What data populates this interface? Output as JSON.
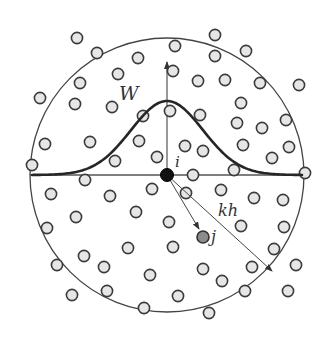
{
  "diagram": {
    "labels": {
      "kernel": "W",
      "center_particle": "i",
      "neighbor_particle": "j",
      "support_radius": "kh"
    },
    "colors": {
      "background": "#ffffff",
      "stroke": "#333333",
      "kernel_curve": "#262626",
      "particle_fill": "#e6e6e6",
      "particle_stroke": "#3a3a3a",
      "center_particle_fill": "#111111",
      "neighbor_particle_fill": "#8c8c8c"
    },
    "support_circle": {
      "cx": 167,
      "cy": 175,
      "r": 137
    },
    "center_particle": {
      "x": 167,
      "y": 175,
      "r": 6
    },
    "neighbor_particle": {
      "x": 203,
      "y": 237,
      "r": 6
    },
    "particles": [
      [
        77,
        38
      ],
      [
        97,
        53
      ],
      [
        138,
        58
      ],
      [
        118,
        74
      ],
      [
        80,
        83
      ],
      [
        40,
        98
      ],
      [
        75,
        104
      ],
      [
        112,
        107
      ],
      [
        143,
        116
      ],
      [
        45,
        144
      ],
      [
        90,
        142
      ],
      [
        139,
        141
      ],
      [
        32,
        165
      ],
      [
        115,
        161
      ],
      [
        157,
        157
      ],
      [
        215,
        35
      ],
      [
        175,
        46
      ],
      [
        215,
        56
      ],
      [
        246,
        51
      ],
      [
        173,
        71
      ],
      [
        198,
        81
      ],
      [
        225,
        80
      ],
      [
        260,
        83
      ],
      [
        299,
        85
      ],
      [
        241,
        103
      ],
      [
        170,
        111
      ],
      [
        200,
        115
      ],
      [
        237,
        123
      ],
      [
        262,
        128
      ],
      [
        286,
        120
      ],
      [
        185,
        146
      ],
      [
        203,
        151
      ],
      [
        243,
        145
      ],
      [
        289,
        147
      ],
      [
        272,
        158
      ],
      [
        234,
        170
      ],
      [
        305,
        173
      ],
      [
        85,
        180
      ],
      [
        51,
        194
      ],
      [
        110,
        196
      ],
      [
        152,
        189
      ],
      [
        76,
        217
      ],
      [
        136,
        212
      ],
      [
        47,
        228
      ],
      [
        128,
        248
      ],
      [
        84,
        256
      ],
      [
        57,
        265
      ],
      [
        104,
        267
      ],
      [
        150,
        275
      ],
      [
        72,
        295
      ],
      [
        107,
        291
      ],
      [
        144,
        308
      ],
      [
        193,
        175
      ],
      [
        186,
        193
      ],
      [
        221,
        190
      ],
      [
        254,
        198
      ],
      [
        283,
        200
      ],
      [
        169,
        222
      ],
      [
        241,
        226
      ],
      [
        284,
        227
      ],
      [
        173,
        247
      ],
      [
        274,
        249
      ],
      [
        296,
        265
      ],
      [
        203,
        269
      ],
      [
        252,
        267
      ],
      [
        222,
        281
      ],
      [
        178,
        296
      ],
      [
        245,
        291
      ],
      [
        288,
        291
      ],
      [
        209,
        313
      ]
    ]
  }
}
